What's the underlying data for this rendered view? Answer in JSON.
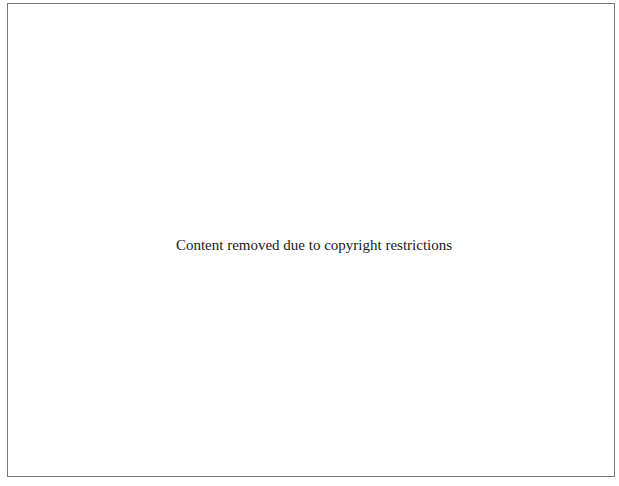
{
  "placeholder": {
    "message": "Content removed due to copyright restrictions"
  },
  "colors": {
    "border": "#7a7a7a",
    "background": "#ffffff",
    "text": "#1a1a1a"
  }
}
